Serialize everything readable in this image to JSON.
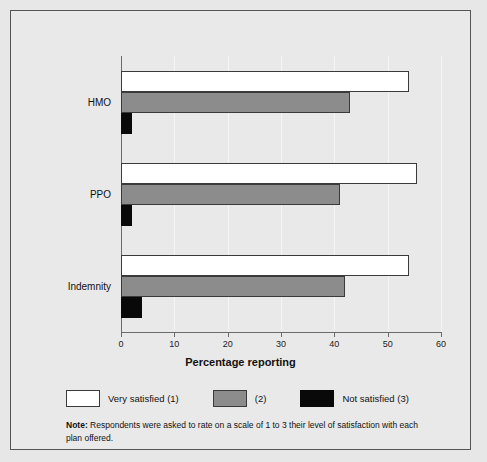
{
  "chart_data": {
    "type": "bar",
    "orientation": "horizontal",
    "title": "",
    "xlabel": "Percentage reporting",
    "ylabel": "",
    "xlim": [
      0,
      60
    ],
    "xticks": [
      0,
      10,
      20,
      30,
      40,
      50,
      60
    ],
    "xtick_labels": [
      "0",
      "10",
      "20",
      "30",
      "40",
      "50",
      "60"
    ],
    "grid": true,
    "grid_axis": "x",
    "legend_position": "below-axes",
    "categories": [
      "HMO",
      "PPO",
      "Indemnity"
    ],
    "series": [
      {
        "name": "Very satisfied (1)",
        "color": "#ffffff",
        "values": [
          54,
          55.5,
          54
        ]
      },
      {
        "name": "(2)",
        "color": "#8c8c8c",
        "values": [
          43,
          41,
          42
        ]
      },
      {
        "name": "Not satisfied (3)",
        "color": "#090909",
        "values": [
          2,
          2,
          4
        ]
      }
    ]
  },
  "legend": {
    "items": [
      {
        "label": "Very satisfied (1)",
        "swatch": "white-swatch"
      },
      {
        "label": "(2)",
        "swatch": "gray-swatch"
      },
      {
        "label": "Not satisfied (3)",
        "swatch": "black-swatch"
      }
    ]
  },
  "note": {
    "prefix": "Note:",
    "text": " Respondents were asked to rate on a scale of 1 to 3 their level of satisfaction with each plan offered."
  },
  "colors": {
    "background": "#e9e9e9",
    "axis": "#6a6a6a",
    "gridline": "#f5f5f5",
    "border": "#555555",
    "series_1": "#ffffff",
    "series_2": "#8c8c8c",
    "series_3": "#090909"
  }
}
